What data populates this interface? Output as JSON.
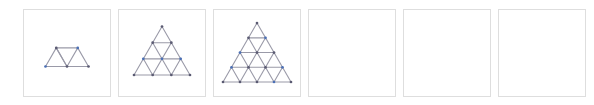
{
  "figure": {
    "type": "image-sequence",
    "panel_count": 6,
    "colors": {
      "background": "#ffffff",
      "panel_border": "#dedede",
      "edge_stroke": "#9a9aa8",
      "vertex_blue": "#4a6fb5",
      "vertex_dark": "#5a5a72"
    },
    "layout": {
      "panel_width": 88,
      "panel_height": 88,
      "panel_gap": 7,
      "left_offset": 23,
      "top_offset": 9
    }
  },
  "panels": [
    {
      "index": 1,
      "name": "panel-1",
      "state": "filled",
      "shape": "triangular-lattice",
      "rows": 2,
      "label": "",
      "upward_triangles": 3,
      "downward_triangles": 1,
      "vertex_count": 6,
      "edge_count": 9
    },
    {
      "index": 2,
      "name": "panel-2",
      "state": "filled",
      "shape": "triangular-lattice",
      "rows": 3,
      "label": "",
      "upward_triangles": 6,
      "downward_triangles": 3,
      "vertex_count": 10,
      "edge_count": 18
    },
    {
      "index": 3,
      "name": "panel-3",
      "state": "filled",
      "shape": "triangular-lattice",
      "rows": 4,
      "label": "",
      "upward_triangles": 10,
      "downward_triangles": 6,
      "vertex_count": 15,
      "edge_count": 30
    },
    {
      "index": 4,
      "name": "panel-4",
      "state": "empty",
      "shape": "none",
      "rows": 0,
      "label": ""
    },
    {
      "index": 5,
      "name": "panel-5",
      "state": "empty",
      "shape": "none",
      "rows": 0,
      "label": ""
    },
    {
      "index": 6,
      "name": "panel-6",
      "state": "empty",
      "shape": "none",
      "rows": 0,
      "label": ""
    }
  ]
}
